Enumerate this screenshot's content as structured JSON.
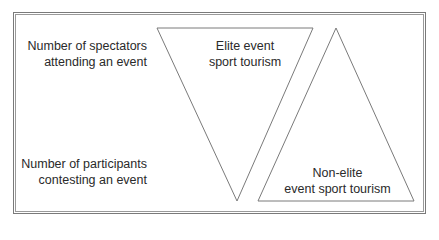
{
  "figure": {
    "axis_labels": {
      "top": [
        "Number of spectators",
        "attending an event"
      ],
      "bottom": [
        "Number of participants",
        "contesting an event"
      ]
    },
    "shapes": {
      "inverted_triangle": {
        "label": [
          "Elite event",
          "sport tourism"
        ]
      },
      "upright_triangle": {
        "label": [
          "Non-elite",
          "event sport tourism"
        ]
      }
    },
    "colors": {
      "line": "#7a7a7a",
      "text": "#2a2a2a",
      "background": "#ffffff"
    }
  }
}
